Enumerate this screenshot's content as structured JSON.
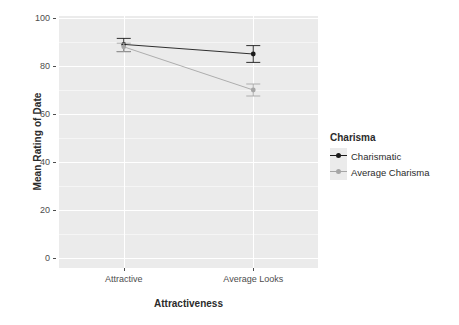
{
  "chart_data": {
    "type": "line",
    "title": "",
    "xlabel": "Attractiveness",
    "ylabel": "Mean Rating of Date",
    "categories": [
      "Attractive",
      "Average Looks"
    ],
    "ylim": [
      0,
      100
    ],
    "yticks": [
      0,
      20,
      40,
      60,
      80,
      100
    ],
    "ytick_labels": [
      "0",
      "20",
      "40",
      "60",
      "80",
      "100"
    ],
    "grid": true,
    "legend_position": "right",
    "legend_title": "Charisma",
    "series": [
      {
        "name": "Charismatic",
        "color": "#1a1a1a",
        "values": [
          89,
          85
        ],
        "errors_low": [
          86,
          81.5
        ],
        "errors_high": [
          91.5,
          88.5
        ]
      },
      {
        "name": "Average Charisma",
        "color": "#a6a6a6",
        "values": [
          88,
          70
        ],
        "errors_low": [
          86,
          67.5
        ],
        "errors_high": [
          89.5,
          72.5
        ]
      }
    ]
  },
  "axes": {
    "y_title": "Mean Rating of Date",
    "x_title": "Attractiveness",
    "y_tick_labels": [
      "100",
      "80",
      "60",
      "40",
      "20",
      "0"
    ],
    "x_tick_labels": [
      "Attractive",
      "Average Looks"
    ]
  },
  "legend": {
    "title": "Charisma",
    "items": [
      {
        "label": "Charismatic",
        "color": "#1a1a1a"
      },
      {
        "label": "Average Charisma",
        "color": "#a6a6a6"
      }
    ]
  },
  "colors": {
    "panel_background": "#ebebeb",
    "grid_major": "#ffffff",
    "grid_minor": "#f5f5f5",
    "axis_text": "#4d4d4d",
    "title_text": "#2b2b2b",
    "series_dark": "#1a1a1a",
    "series_light": "#a6a6a6"
  }
}
